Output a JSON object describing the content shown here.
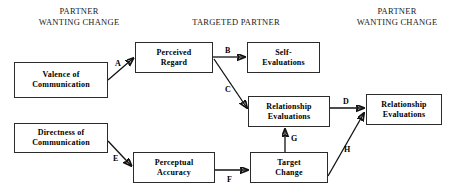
{
  "diagram": {
    "type": "path-diagram",
    "column_headers": [
      {
        "id": "left",
        "text": "PARTNER\nWANTING CHANGE"
      },
      {
        "id": "middle",
        "text": "TARGETED PARTNER"
      },
      {
        "id": "right",
        "text": "PARTNER\nWANTING CHANGE"
      }
    ],
    "nodes": [
      {
        "id": "valence-of-communication",
        "label": "Valence of\nCommunication"
      },
      {
        "id": "directness-of-communication",
        "label": "Directness of\nCommunication"
      },
      {
        "id": "perceived-regard",
        "label": "Perceived\nRegard"
      },
      {
        "id": "perceptual-accuracy",
        "label": "Perceptual\nAccuracy"
      },
      {
        "id": "self-evaluations",
        "label": "Self-\nEvaluations"
      },
      {
        "id": "relationship-evaluations-target",
        "label": "Relationship\nEvaluations"
      },
      {
        "id": "target-change",
        "label": "Target\nChange"
      },
      {
        "id": "relationship-evaluations-actor",
        "label": "Relationship\nEvaluations"
      }
    ],
    "edges": [
      {
        "id": "edge-a",
        "label": "A",
        "from": "valence-of-communication",
        "to": "perceived-regard"
      },
      {
        "id": "edge-b",
        "label": "B",
        "from": "perceived-regard",
        "to": "self-evaluations"
      },
      {
        "id": "edge-c",
        "label": "C",
        "from": "perceived-regard",
        "to": "relationship-evaluations-target"
      },
      {
        "id": "edge-d",
        "label": "D",
        "from": "relationship-evaluations-target",
        "to": "relationship-evaluations-actor"
      },
      {
        "id": "edge-e",
        "label": "E",
        "from": "directness-of-communication",
        "to": "perceptual-accuracy"
      },
      {
        "id": "edge-f",
        "label": "F",
        "from": "perceptual-accuracy",
        "to": "target-change"
      },
      {
        "id": "edge-g",
        "label": "G",
        "from": "target-change",
        "to": "relationship-evaluations-target"
      },
      {
        "id": "edge-h",
        "label": "H",
        "from": "target-change",
        "to": "relationship-evaluations-actor"
      }
    ],
    "colors": {
      "line": "#111111",
      "box_border": "#2b2b2b",
      "background": "#ffffff",
      "text": "#000000"
    }
  }
}
